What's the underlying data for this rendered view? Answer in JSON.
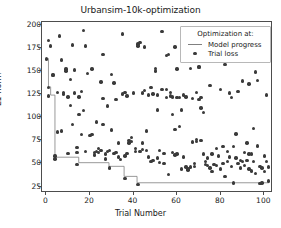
{
  "chart_data": {
    "type": "scatter",
    "title": "Urbansim-10k-optimization",
    "xlabel": "Trial Number",
    "ylabel": "L1-norm",
    "xlim": [
      -2,
      104
    ],
    "ylim": [
      18,
      203
    ],
    "xticks": [
      0,
      20,
      40,
      60,
      80,
      100
    ],
    "yticks": [
      25,
      50,
      75,
      100,
      125,
      150,
      175,
      200
    ],
    "grid": false,
    "legend": {
      "title": "Optimization at:",
      "position": "upper right",
      "entries": [
        {
          "label": "Model progress",
          "type": "line",
          "color": "#808080"
        },
        {
          "label": "Trial loss",
          "type": "marker",
          "color": "#3a3a3a"
        }
      ]
    },
    "series": [
      {
        "name": "Trial loss",
        "type": "scatter",
        "color": "#3a3a3a",
        "points": [
          [
            0,
            163
          ],
          [
            1,
            183
          ],
          [
            1,
            132
          ],
          [
            1,
            123
          ],
          [
            2,
            177
          ],
          [
            3,
            145
          ],
          [
            3,
            146
          ],
          [
            4,
            58
          ],
          [
            4,
            55
          ],
          [
            5,
            127
          ],
          [
            5,
            84
          ],
          [
            6,
            188
          ],
          [
            7,
            162
          ],
          [
            8,
            127
          ],
          [
            8,
            125
          ],
          [
            9,
            152
          ],
          [
            9,
            150
          ],
          [
            10,
            122
          ],
          [
            11,
            141
          ],
          [
            11,
            113
          ],
          [
            12,
            178
          ],
          [
            12,
            92
          ],
          [
            13,
            151
          ],
          [
            14,
            67
          ],
          [
            14,
            62
          ],
          [
            14,
            49
          ],
          [
            15,
            122
          ],
          [
            15,
            103
          ],
          [
            16,
            128
          ],
          [
            16,
            81
          ],
          [
            17,
            194
          ],
          [
            18,
            177
          ],
          [
            18,
            63
          ],
          [
            19,
            147
          ],
          [
            20,
            80
          ],
          [
            21,
            81
          ],
          [
            22,
            62
          ],
          [
            22,
            59
          ],
          [
            23,
            95
          ],
          [
            23,
            63
          ],
          [
            24,
            66
          ],
          [
            24,
            62
          ],
          [
            25,
            138
          ],
          [
            25,
            64
          ],
          [
            26,
            168
          ],
          [
            26,
            92
          ],
          [
            27,
            60
          ],
          [
            27,
            55
          ],
          [
            28,
            112
          ],
          [
            28,
            63
          ],
          [
            29,
            64
          ],
          [
            29,
            45
          ],
          [
            30,
            146
          ],
          [
            30,
            86
          ],
          [
            31,
            137
          ],
          [
            31,
            61
          ],
          [
            32,
            62
          ],
          [
            33,
            72
          ],
          [
            33,
            57
          ],
          [
            34,
            54
          ],
          [
            35,
            190
          ],
          [
            35,
            125
          ],
          [
            36,
            127
          ],
          [
            36,
            58
          ],
          [
            36,
            34
          ],
          [
            37,
            123
          ],
          [
            38,
            75
          ],
          [
            38,
            72
          ],
          [
            39,
            78
          ],
          [
            39,
            74
          ],
          [
            40,
            126
          ],
          [
            41,
            66
          ],
          [
            41,
            63
          ],
          [
            42,
            177
          ],
          [
            42,
            179
          ],
          [
            42,
            27
          ],
          [
            43,
            181
          ],
          [
            43,
            63
          ],
          [
            44,
            72
          ],
          [
            44,
            65
          ],
          [
            45,
            176
          ],
          [
            45,
            129
          ],
          [
            46,
            85
          ],
          [
            46,
            64
          ],
          [
            47,
            124
          ],
          [
            47,
            57
          ],
          [
            48,
            132
          ],
          [
            48,
            52
          ],
          [
            49,
            125
          ],
          [
            49,
            53
          ],
          [
            50,
            150
          ],
          [
            50,
            153
          ],
          [
            51,
            108
          ],
          [
            51,
            56
          ],
          [
            52,
            64
          ],
          [
            52,
            51
          ],
          [
            53,
            193
          ],
          [
            53,
            130
          ],
          [
            54,
            61
          ],
          [
            54,
            50
          ],
          [
            55,
            167
          ],
          [
            55,
            130
          ],
          [
            55,
            121
          ],
          [
            56,
            168
          ],
          [
            56,
            38
          ],
          [
            57,
            127
          ],
          [
            57,
            123
          ],
          [
            58,
            103
          ],
          [
            58,
            62
          ],
          [
            59,
            176
          ],
          [
            59,
            87
          ],
          [
            59,
            59
          ],
          [
            60,
            152
          ],
          [
            60,
            121
          ],
          [
            60,
            60
          ],
          [
            61,
            121
          ],
          [
            61,
            90
          ],
          [
            62,
            108
          ],
          [
            62,
            44
          ],
          [
            63,
            124
          ],
          [
            63,
            57
          ],
          [
            64,
            46
          ],
          [
            65,
            44
          ],
          [
            65,
            43
          ],
          [
            66,
            153
          ],
          [
            66,
            46
          ],
          [
            67,
            120
          ],
          [
            67,
            73
          ],
          [
            68,
            50
          ],
          [
            68,
            47
          ],
          [
            69,
            127
          ],
          [
            69,
            76
          ],
          [
            69,
            74
          ],
          [
            70,
            155
          ],
          [
            70,
            154
          ],
          [
            70,
            119
          ],
          [
            71,
            110
          ],
          [
            71,
            75
          ],
          [
            72,
            105
          ],
          [
            72,
            60
          ],
          [
            73,
            52
          ],
          [
            73,
            49
          ],
          [
            74,
            56
          ],
          [
            74,
            48
          ],
          [
            75,
            134
          ],
          [
            75,
            45
          ],
          [
            76,
            60
          ],
          [
            76,
            41
          ],
          [
            77,
            49
          ],
          [
            78,
            48
          ],
          [
            79,
            58
          ],
          [
            80,
            130
          ],
          [
            80,
            44
          ],
          [
            81,
            68
          ],
          [
            81,
            50
          ],
          [
            82,
            157
          ],
          [
            82,
            36
          ],
          [
            83,
            63
          ],
          [
            83,
            52
          ],
          [
            84,
            126
          ],
          [
            84,
            57
          ],
          [
            85,
            121
          ],
          [
            85,
            47
          ],
          [
            86,
            29
          ],
          [
            87,
            82
          ],
          [
            87,
            56
          ],
          [
            88,
            128
          ],
          [
            88,
            50
          ],
          [
            89,
            53
          ],
          [
            89,
            45
          ],
          [
            90,
            139
          ],
          [
            90,
            52
          ],
          [
            91,
            62
          ],
          [
            91,
            48
          ],
          [
            92,
            72
          ],
          [
            92,
            53
          ],
          [
            93,
            136
          ],
          [
            93,
            44
          ],
          [
            94,
            60
          ],
          [
            94,
            42
          ],
          [
            95,
            88
          ],
          [
            95,
            52
          ],
          [
            96,
            149
          ],
          [
            96,
            39
          ],
          [
            97,
            140
          ],
          [
            97,
            69
          ],
          [
            98,
            47
          ],
          [
            98,
            28
          ],
          [
            99,
            45
          ],
          [
            99,
            29
          ],
          [
            100,
            41
          ],
          [
            101,
            124
          ],
          [
            101,
            52
          ],
          [
            102,
            46
          ],
          [
            102,
            31
          ],
          [
            7,
            85
          ],
          [
            10,
            61
          ],
          [
            13,
            126
          ],
          [
            17,
            107
          ],
          [
            21,
            152
          ],
          [
            26,
            120
          ],
          [
            32,
            119
          ],
          [
            37,
            61
          ],
          [
            44,
            126
          ],
          [
            51,
            124
          ],
          [
            58,
            122
          ],
          [
            64,
            122
          ],
          [
            71,
            121
          ],
          [
            78,
            66
          ],
          [
            86,
            68
          ],
          [
            93,
            60
          ],
          [
            100,
            58
          ]
        ]
      },
      {
        "name": "Model progress",
        "type": "step",
        "color": "#808080",
        "points": [
          [
            0,
            163
          ],
          [
            1,
            163
          ],
          [
            1,
            132
          ],
          [
            2,
            132
          ],
          [
            2,
            123
          ],
          [
            4,
            123
          ],
          [
            4,
            55
          ],
          [
            15,
            55
          ],
          [
            15,
            49
          ],
          [
            29,
            49
          ],
          [
            29,
            45
          ],
          [
            36,
            45
          ],
          [
            36,
            34
          ],
          [
            42,
            34
          ],
          [
            42,
            27
          ],
          [
            103,
            27
          ]
        ]
      }
    ]
  }
}
